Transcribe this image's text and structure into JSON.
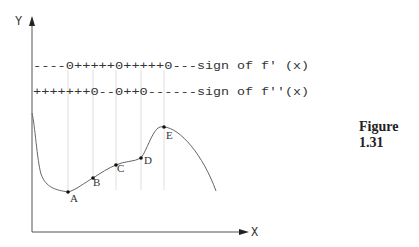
{
  "axes": {
    "y_label": "Y",
    "x_label": "X"
  },
  "sign_rows": {
    "first_derivative": {
      "pattern": "----0+++++0+++++0---",
      "label": "sign of f' (x)"
    },
    "second_derivative": {
      "pattern": "+++++++0--0++0------",
      "label": "sign of f''(x)"
    }
  },
  "points": [
    {
      "name": "A",
      "x": 68,
      "y": 192
    },
    {
      "name": "B",
      "x": 93,
      "y": 178
    },
    {
      "name": "C",
      "x": 116,
      "y": 165
    },
    {
      "name": "D",
      "x": 141,
      "y": 158
    },
    {
      "name": "E",
      "x": 164,
      "y": 127
    }
  ],
  "caption": "Figure 1.31",
  "colors": {
    "curve": "#666666",
    "axis": "#555555",
    "guide": "#dddddd",
    "text": "#333333"
  }
}
